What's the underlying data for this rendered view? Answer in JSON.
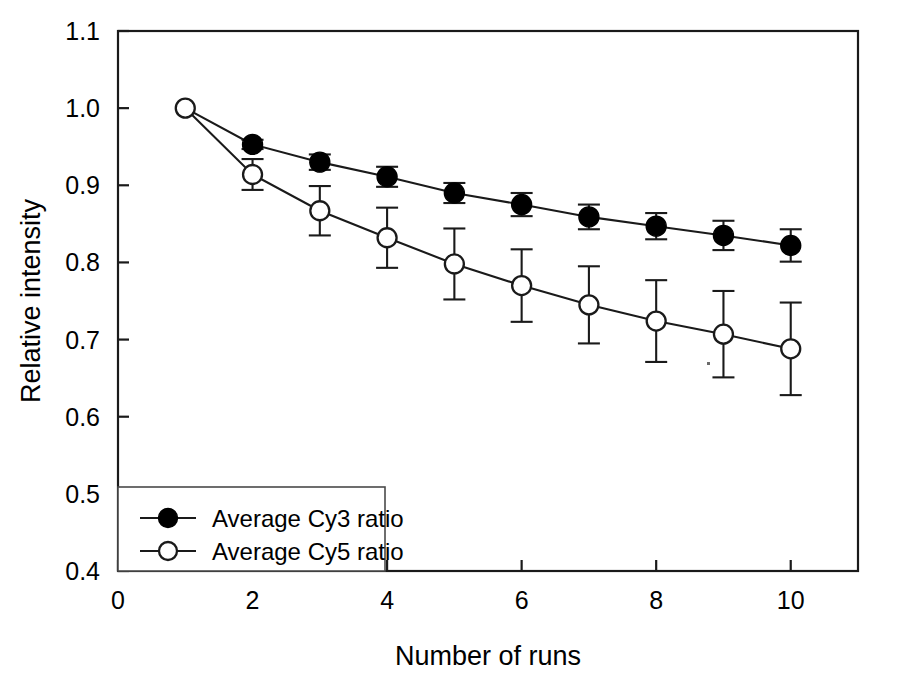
{
  "chart_data": {
    "type": "line",
    "title": "",
    "subtitle": "",
    "xlabel": "Number of runs",
    "ylabel": "Relative intensity",
    "xlim": [
      0,
      11
    ],
    "ylim": [
      0.4,
      1.1
    ],
    "grid": false,
    "legend_position": "bottom-left",
    "x_ticks": [
      0,
      2,
      4,
      6,
      8,
      10
    ],
    "x_tick_labels": [
      "0",
      "2",
      "4",
      "6",
      "8",
      "10"
    ],
    "x_minor_ticks": [
      1,
      3,
      5,
      7,
      9,
      11
    ],
    "y_ticks": [
      0.4,
      0.5,
      0.6,
      0.7,
      0.8,
      0.9,
      1.0,
      1.1
    ],
    "y_tick_labels": [
      "0.4",
      "0.5",
      "0.6",
      "0.7",
      "0.8",
      "0.9",
      "1.0",
      "1.1"
    ],
    "x": [
      1,
      2,
      3,
      4,
      5,
      6,
      7,
      8,
      9,
      10
    ],
    "series": [
      {
        "name": "Average Cy3  ratio",
        "marker": "filled-circle",
        "color": "#000000",
        "values": [
          1.0,
          0.953,
          0.93,
          0.911,
          0.89,
          0.875,
          0.859,
          0.847,
          0.835,
          0.822
        ],
        "errors": [
          0.0,
          0.006,
          0.01,
          0.013,
          0.013,
          0.015,
          0.016,
          0.017,
          0.019,
          0.021
        ]
      },
      {
        "name": "Average Cy5  ratio",
        "marker": "open-circle",
        "color": "#ffffff",
        "values": [
          1.0,
          0.914,
          0.867,
          0.832,
          0.798,
          0.77,
          0.745,
          0.724,
          0.707,
          0.688
        ],
        "errors": [
          0.0,
          0.02,
          0.032,
          0.039,
          0.046,
          0.047,
          0.05,
          0.053,
          0.056,
          0.06
        ]
      }
    ],
    "legend_entries": [
      {
        "label": "Average Cy3  ratio",
        "marker": "filled-circle"
      },
      {
        "label": "Average Cy5  ratio",
        "marker": "open-circle"
      }
    ]
  }
}
